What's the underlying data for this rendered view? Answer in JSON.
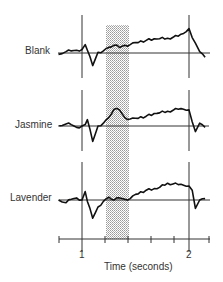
{
  "chart_data": {
    "type": "line",
    "title": "",
    "xlabel": "Time (seconds)",
    "ylabel": "",
    "x_ticks": [
      1,
      2
    ],
    "x_minor_ticks": [
      0.78,
      1.21,
      1.43,
      1.64,
      1.86,
      2.19
    ],
    "xlim": [
      0.78,
      2.19
    ],
    "shaded_interval": [
      1.21,
      1.44
    ],
    "grid": false,
    "legend": null,
    "series": [
      {
        "name": "Blank",
        "x": [
          0.78,
          0.85,
          0.9,
          0.95,
          1.0,
          1.03,
          1.05,
          1.1,
          1.15,
          1.2,
          1.25,
          1.3,
          1.35,
          1.4,
          1.45,
          1.5,
          1.6,
          1.7,
          1.8,
          1.9,
          1.95,
          2.0,
          2.03,
          2.06,
          2.1,
          2.15
        ],
        "y": [
          -0.1,
          0.1,
          0.15,
          0.2,
          0.25,
          0.6,
          0.2,
          -0.9,
          0.05,
          0.15,
          0.4,
          0.55,
          0.4,
          0.55,
          0.6,
          0.75,
          0.9,
          1.0,
          1.05,
          1.2,
          1.4,
          1.75,
          1.1,
          0.7,
          0.1,
          -0.3
        ]
      },
      {
        "name": "Jasmine",
        "x": [
          0.78,
          0.85,
          0.9,
          0.95,
          1.0,
          1.03,
          1.05,
          1.1,
          1.15,
          1.2,
          1.25,
          1.3,
          1.35,
          1.4,
          1.45,
          1.5,
          1.6,
          1.7,
          1.8,
          1.9,
          1.95,
          2.0,
          2.03,
          2.06,
          2.1,
          2.15
        ],
        "y": [
          0.0,
          0.15,
          0.1,
          -0.1,
          0.0,
          0.1,
          0.45,
          -1.1,
          0.0,
          0.2,
          0.6,
          1.2,
          1.15,
          0.6,
          0.5,
          0.55,
          0.7,
          0.9,
          1.05,
          1.2,
          1.2,
          1.15,
          0.3,
          -0.4,
          0.2,
          -0.1
        ]
      },
      {
        "name": "Lavender",
        "x": [
          0.78,
          0.85,
          0.9,
          0.95,
          1.0,
          1.03,
          1.05,
          1.1,
          1.15,
          1.2,
          1.25,
          1.3,
          1.35,
          1.4,
          1.45,
          1.5,
          1.6,
          1.7,
          1.8,
          1.9,
          1.95,
          2.0,
          2.03,
          2.06,
          2.1,
          2.15
        ],
        "y": [
          0.0,
          -0.2,
          0.05,
          0.15,
          0.0,
          0.6,
          -0.1,
          -1.3,
          -0.5,
          -0.1,
          0.2,
          0.0,
          0.15,
          0.05,
          0.1,
          0.4,
          0.7,
          0.8,
          1.2,
          1.1,
          1.05,
          1.0,
          0.7,
          -0.6,
          0.0,
          0.1
        ]
      }
    ]
  },
  "labels": {
    "blank": "Blank",
    "jasmine": "Jasmine",
    "lavender": "Lavender",
    "tick_1": "1",
    "tick_2": "2",
    "xlabel": "Time (seconds)"
  }
}
